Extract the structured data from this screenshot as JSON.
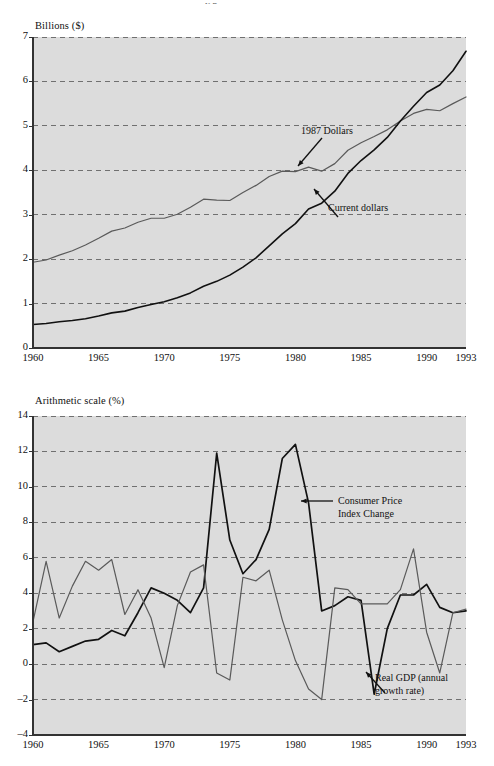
{
  "figure": {
    "background": "#ffffff",
    "plot_background": "#dcdcdc",
    "top_cropped_text": "y p"
  },
  "chart_data": [
    {
      "id": "gdp-levels",
      "type": "line",
      "title": "",
      "ylabel": "Billions ($)",
      "xlabel": "",
      "ylim": [
        0,
        7
      ],
      "xlim": [
        1960,
        1993
      ],
      "yticks": [
        0,
        1,
        2,
        3,
        4,
        5,
        6,
        7
      ],
      "xticks": [
        1960,
        1965,
        1970,
        1975,
        1980,
        1985,
        1990,
        1993
      ],
      "grid": true,
      "grid_style": "dashed",
      "legend": "annotations",
      "annotations": [
        {
          "text": "1987 Dollars",
          "target_x": 1983,
          "target_y": 4.05,
          "color": "#111111"
        },
        {
          "text": "Current dollars",
          "target_x": 1984.5,
          "target_y": 3.6,
          "color": "#111111"
        }
      ],
      "x": [
        1960,
        1961,
        1962,
        1963,
        1964,
        1965,
        1966,
        1967,
        1968,
        1969,
        1970,
        1971,
        1972,
        1973,
        1974,
        1975,
        1976,
        1977,
        1978,
        1979,
        1980,
        1981,
        1982,
        1983,
        1984,
        1985,
        1986,
        1987,
        1988,
        1989,
        1990,
        1991,
        1992,
        1993
      ],
      "series": [
        {
          "name": "1987 Dollars",
          "color": "#5a5a5a",
          "width": 1.2,
          "values": [
            1.93,
            1.98,
            2.09,
            2.19,
            2.32,
            2.47,
            2.63,
            2.7,
            2.83,
            2.92,
            2.92,
            3.01,
            3.17,
            3.35,
            3.33,
            3.32,
            3.5,
            3.66,
            3.86,
            3.98,
            3.97,
            4.07,
            3.98,
            4.15,
            4.45,
            4.62,
            4.76,
            4.91,
            5.11,
            5.28,
            5.37,
            5.34,
            5.5,
            5.65
          ]
        },
        {
          "name": "Current dollars",
          "color": "#111111",
          "width": 1.6,
          "values": [
            0.53,
            0.55,
            0.59,
            0.62,
            0.66,
            0.72,
            0.79,
            0.83,
            0.91,
            0.98,
            1.04,
            1.13,
            1.24,
            1.39,
            1.5,
            1.64,
            1.82,
            2.03,
            2.3,
            2.57,
            2.8,
            3.13,
            3.26,
            3.53,
            3.93,
            4.22,
            4.46,
            4.74,
            5.11,
            5.44,
            5.75,
            5.92,
            6.24,
            6.68
          ]
        }
      ]
    },
    {
      "id": "inflation-growth",
      "type": "line",
      "title": "",
      "ylabel": "Arithmetic scale (%)",
      "xlabel": "",
      "ylim": [
        -4,
        14
      ],
      "xlim": [
        1960,
        1993
      ],
      "yticks": [
        -4,
        -2,
        0,
        2,
        4,
        6,
        8,
        10,
        12,
        14
      ],
      "ytick_labels": [
        "-4",
        "-2",
        "0",
        "2",
        "4",
        "6",
        "8",
        "10",
        "12",
        "14"
      ],
      "xticks": [
        1960,
        1965,
        1970,
        1975,
        1980,
        1985,
        1990,
        1993
      ],
      "grid": true,
      "grid_style": "dashed",
      "legend": "annotations",
      "annotations": [
        {
          "text": "Consumer Price\nIndex Change",
          "line1": "Consumer Price",
          "line2": "Index Change",
          "target_x": 1980.5,
          "target_y": 9.0,
          "color": "#111111"
        },
        {
          "text": "Real GDP (annual\ngrowth rate)",
          "line1": "Real GDP (annual",
          "line2": "growth rate)",
          "target_x": 1986.5,
          "target_y": 0.7,
          "color": "#111111"
        }
      ],
      "x": [
        1960,
        1961,
        1962,
        1963,
        1964,
        1965,
        1966,
        1967,
        1968,
        1969,
        1970,
        1971,
        1972,
        1973,
        1974,
        1975,
        1976,
        1977,
        1978,
        1979,
        1980,
        1981,
        1982,
        1983,
        1984,
        1985,
        1986,
        1987,
        1988,
        1989,
        1990,
        1991,
        1992,
        1993
      ],
      "series": [
        {
          "name": "Consumer Price Index Change",
          "color": "#111111",
          "width": 1.7,
          "values": [
            1.1,
            1.2,
            0.7,
            1.0,
            1.3,
            1.4,
            1.9,
            1.6,
            2.9,
            4.3,
            4.0,
            3.6,
            2.9,
            4.3,
            11.9,
            7.0,
            5.1,
            5.9,
            7.6,
            11.6,
            12.4,
            9.1,
            3.0,
            3.3,
            3.8,
            3.6,
            -1.7,
            2.0,
            3.9,
            3.9,
            4.5,
            3.2,
            2.9,
            3.0
          ]
        },
        {
          "name": "Real GDP (annual growth rate)",
          "color": "#5a5a5a",
          "width": 1.2,
          "values": [
            2.4,
            5.8,
            2.6,
            4.4,
            5.8,
            5.3,
            5.9,
            2.8,
            4.2,
            2.6,
            -0.2,
            3.3,
            5.2,
            5.6,
            -0.5,
            -0.9,
            4.9,
            4.7,
            5.3,
            2.5,
            0.2,
            -1.4,
            -2.0,
            4.3,
            4.2,
            3.4,
            3.4,
            3.4,
            4.2,
            6.5,
            1.8,
            -0.5,
            2.9,
            3.1
          ]
        }
      ]
    }
  ]
}
